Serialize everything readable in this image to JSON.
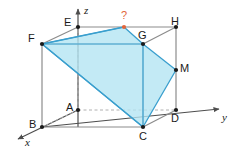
{
  "figure": {
    "background": "#ffffff",
    "width": 237,
    "height": 151
  },
  "colors": {
    "edge_solid": "#8c8c8c",
    "edge_hidden": "#b3b3b3",
    "section_fill": "#b2e4f2",
    "section_stroke": "#3a9fce",
    "vertex_dot": "#1a1a1a",
    "question_color": "#e2653a",
    "axis": "#4d4d4d",
    "label_color": "#1a1a1a"
  },
  "axes": [
    {
      "name": "z",
      "label": "z",
      "label_x": 84,
      "label_y": 6,
      "from_x": 78,
      "from_y": 127,
      "to_x": 78,
      "to_y": 7
    },
    {
      "name": "y",
      "label": "y",
      "label_x": 222,
      "label_y": 113,
      "from_x": 42,
      "from_y": 127,
      "to_x": 224,
      "to_y": 109
    },
    {
      "name": "x",
      "label": "x",
      "label_x": 25,
      "label_y": 138,
      "from_x": 78,
      "from_y": 110,
      "to_x": 14,
      "to_y": 141
    }
  ],
  "vertices": [
    {
      "name": "A",
      "label": "A",
      "x": 78,
      "y": 110,
      "label_x": 66,
      "label_y": 103,
      "dot": true
    },
    {
      "name": "B",
      "label": "B",
      "x": 42,
      "y": 127,
      "label_x": 29,
      "label_y": 120,
      "dot": true
    },
    {
      "name": "C",
      "label": "C",
      "x": 143,
      "y": 127,
      "label_x": 139,
      "label_y": 132,
      "dot": true
    },
    {
      "name": "D",
      "label": "D",
      "x": 176,
      "y": 110,
      "label_x": 172,
      "label_y": 114,
      "dot": true
    },
    {
      "name": "E",
      "label": "E",
      "x": 78,
      "y": 27,
      "label_x": 65,
      "label_y": 18,
      "dot": true
    },
    {
      "name": "F",
      "label": "F",
      "x": 42,
      "y": 44,
      "label_x": 29,
      "label_y": 34,
      "dot": true
    },
    {
      "name": "G",
      "label": "G",
      "x": 143,
      "y": 44,
      "label_x": 139,
      "label_y": 31,
      "dot": true
    },
    {
      "name": "H",
      "label": "H",
      "x": 176,
      "y": 27,
      "label_x": 172,
      "label_y": 17,
      "dot": true
    },
    {
      "name": "M",
      "label": "M",
      "x": 176,
      "y": 70,
      "label_x": 181,
      "label_y": 64,
      "dot": true
    }
  ],
  "question_point": {
    "name": "unknown-point",
    "label": "?",
    "x": 124,
    "y": 27,
    "label_x": 120,
    "label_y": 11
  },
  "solid_edges": [
    {
      "name": "edge-E-H",
      "x1": 78,
      "y1": 27,
      "x2": 176,
      "y2": 27
    },
    {
      "name": "edge-E-F",
      "x1": 78,
      "y1": 27,
      "x2": 42,
      "y2": 44
    },
    {
      "name": "edge-F-G",
      "x1": 42,
      "y1": 44,
      "x2": 143,
      "y2": 44
    },
    {
      "name": "edge-G-H",
      "x1": 143,
      "y1": 44,
      "x2": 176,
      "y2": 27
    },
    {
      "name": "edge-F-B",
      "x1": 42,
      "y1": 44,
      "x2": 42,
      "y2": 127
    },
    {
      "name": "edge-G-C",
      "x1": 143,
      "y1": 44,
      "x2": 143,
      "y2": 127
    },
    {
      "name": "edge-H-D",
      "x1": 176,
      "y1": 27,
      "x2": 176,
      "y2": 110
    },
    {
      "name": "edge-B-C",
      "x1": 42,
      "y1": 127,
      "x2": 143,
      "y2": 127
    },
    {
      "name": "edge-C-D",
      "x1": 143,
      "y1": 127,
      "x2": 176,
      "y2": 110
    }
  ],
  "hidden_edges": [
    {
      "name": "edge-A-E",
      "x1": 78,
      "y1": 110,
      "x2": 78,
      "y2": 27
    },
    {
      "name": "edge-A-B",
      "x1": 78,
      "y1": 110,
      "x2": 42,
      "y2": 127
    },
    {
      "name": "edge-A-D",
      "x1": 78,
      "y1": 110,
      "x2": 176,
      "y2": 110
    }
  ],
  "section": {
    "name": "cross-section-polygon",
    "points": "42,44 124,27 143,44 176,70 143,127",
    "vertex_names": [
      "F",
      "?",
      "G",
      "M",
      "C"
    ]
  },
  "section_inner_lines": [
    {
      "name": "section-line-F-C",
      "x1": 42,
      "y1": 44,
      "x2": 143,
      "y2": 127
    },
    {
      "name": "section-line-G-C",
      "x1": 143,
      "y1": 44,
      "x2": 143,
      "y2": 127
    },
    {
      "name": "section-line-F-Q",
      "x1": 42,
      "y1": 44,
      "x2": 124,
      "y2": 27
    },
    {
      "name": "section-line-F-G",
      "x1": 42,
      "y1": 44,
      "x2": 143,
      "y2": 44
    }
  ]
}
